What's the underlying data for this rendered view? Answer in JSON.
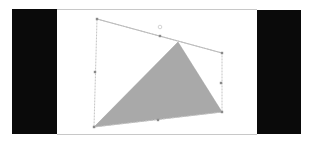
{
  "canvas": {
    "background": "#ffffff",
    "side_panel_color": "#0a0a0a"
  },
  "shape": {
    "type": "triangle",
    "fill": "#a9a9a9",
    "points": [
      [
        178,
        42
      ],
      [
        222,
        112
      ],
      [
        94,
        127
      ]
    ]
  },
  "selection": {
    "color": "#bfbfbf",
    "corners": [
      [
        97,
        19
      ],
      [
        222,
        53
      ],
      [
        222,
        112
      ],
      [
        94,
        127
      ]
    ],
    "handles": [
      [
        97,
        19
      ],
      [
        160,
        36
      ],
      [
        222,
        53
      ],
      [
        221,
        83
      ],
      [
        222,
        112
      ],
      [
        158,
        120
      ],
      [
        94,
        127
      ],
      [
        95,
        72
      ]
    ],
    "rotation_handle": [
      160,
      27
    ]
  }
}
